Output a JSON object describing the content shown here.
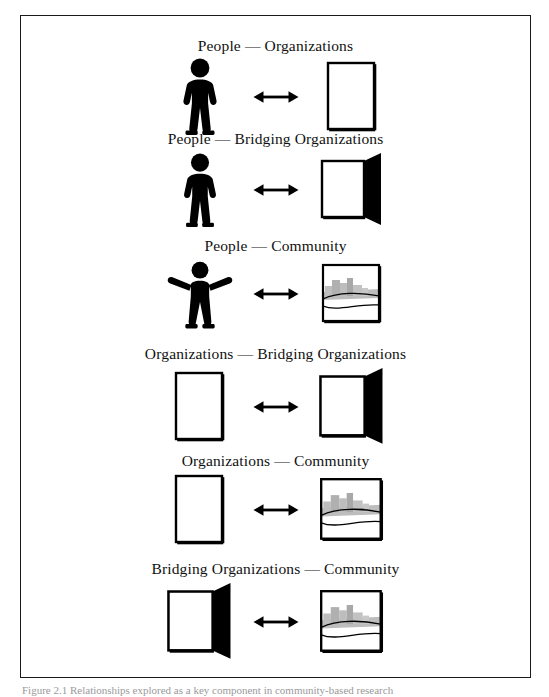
{
  "figure": {
    "caption": "Figure 2.1 Relationships explored as a key component in community-based research",
    "border_color": "#1a1a1a",
    "ink_color": "#000000",
    "community_fill": "#b3b3b3"
  },
  "rows": [
    {
      "title": "People — Organizations",
      "left_icon": "person-arms-down-icon",
      "right_icon": "organization-icon",
      "connector": "double-headed-arrow-icon"
    },
    {
      "title": "People — Bridging Organizations",
      "left_icon": "person-arms-down-icon",
      "right_icon": "bridging-organization-icon",
      "connector": "double-headed-arrow-icon"
    },
    {
      "title": "People — Community",
      "left_icon": "person-arms-out-icon",
      "right_icon": "community-icon",
      "connector": "double-headed-arrow-icon"
    },
    {
      "title": "Organizations — Bridging Organizations",
      "left_icon": "organization-icon",
      "right_icon": "bridging-organization-icon",
      "connector": "double-headed-arrow-icon"
    },
    {
      "title": "Organizations — Community",
      "left_icon": "organization-icon",
      "right_icon": "community-icon",
      "connector": "double-headed-arrow-icon"
    },
    {
      "title": "Bridging Organizations — Community",
      "left_icon": "bridging-organization-icon",
      "right_icon": "community-icon",
      "connector": "double-headed-arrow-icon"
    }
  ],
  "layout": {
    "row_tops": [
      22,
      115,
      222,
      330,
      437,
      545
    ]
  }
}
